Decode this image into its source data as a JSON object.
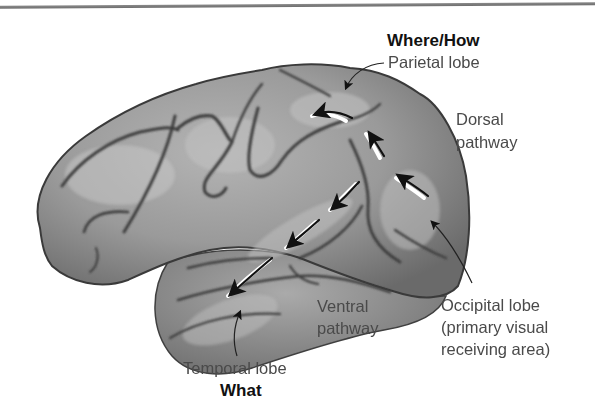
{
  "figure": {
    "labels": {
      "where_how": "Where/How",
      "parietal": "Parietal lobe",
      "dorsal_line1": "Dorsal",
      "dorsal_line2": "pathway",
      "ventral_line1": "Ventral",
      "ventral_line2": "pathway",
      "occipital_line1": "Occipital lobe",
      "occipital_line2": "(primary visual",
      "occipital_line3": "receiving area)",
      "temporal": "Temporal lobe",
      "what": "What"
    },
    "pathways": [
      {
        "name": "dorsal",
        "direction": "occipital-to-parietal",
        "arrows": 3
      },
      {
        "name": "ventral",
        "direction": "occipital-to-temporal",
        "arrows": 3
      }
    ],
    "colors": {
      "brain_fill": "#8f8f8f",
      "brain_highlight": "#b8b8b8",
      "sulcus": "#3e3e3e",
      "text": "#4a4a4a",
      "text_bold": "#111111",
      "arrow": "#111111",
      "arrow_highlight": "#ffffff"
    }
  }
}
